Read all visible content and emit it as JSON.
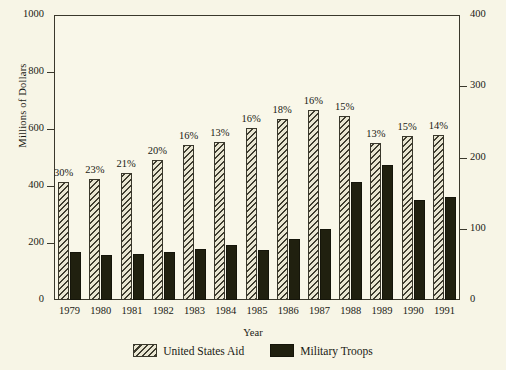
{
  "chart_data": {
    "type": "bar",
    "title": "",
    "xlabel": "Year",
    "ylabel": "Millions of Dollars",
    "y2label": "Jordan's Military Troops in Thousands",
    "grid": false,
    "legend_position": "bottom",
    "ylim": [
      0,
      1000
    ],
    "y2lim": [
      0,
      400
    ],
    "yticks": [
      0,
      200,
      400,
      600,
      800,
      1000
    ],
    "y2ticks": [
      0,
      100,
      200,
      300,
      400
    ],
    "categories": [
      "1979",
      "1980",
      "1981",
      "1982",
      "1983",
      "1984",
      "1985",
      "1986",
      "1987",
      "1988",
      "1989",
      "1990",
      "1991"
    ],
    "series": [
      {
        "name": "United States Aid",
        "axis": "left",
        "unit": "Millions of Dollars",
        "values": [
          415,
          425,
          445,
          490,
          543,
          555,
          605,
          635,
          665,
          645,
          550,
          575,
          580
        ],
        "data_labels": [
          "30%",
          "23%",
          "21%",
          "20%",
          "16%",
          "13%",
          "16%",
          "18%",
          "16%",
          "15%",
          "13%",
          "15%",
          "14%"
        ]
      },
      {
        "name": "Military Troops",
        "axis": "right",
        "unit": "Thousands",
        "values": [
          68,
          63,
          65,
          68,
          72,
          77,
          70,
          85,
          100,
          165,
          190,
          140,
          145
        ],
        "data_labels": []
      }
    ]
  },
  "legend": {
    "items": [
      {
        "label": "United States Aid",
        "swatch": "hatched-swatch"
      },
      {
        "label": "Military Troops",
        "swatch": "solid-dark-swatch"
      }
    ]
  },
  "colors": {
    "background": "#f7f5e6",
    "plot_background": "#f9f7e9",
    "axis": "#3a382c",
    "aid_bar_fill": "#e9e6d2",
    "aid_bar_hatch": "#3f3d30",
    "troops_bar": "#20200f",
    "text": "#1a1a14"
  }
}
